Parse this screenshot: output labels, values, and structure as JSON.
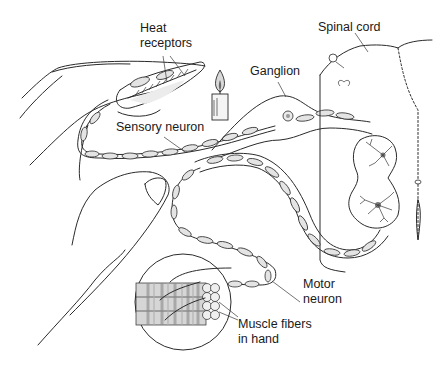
{
  "diagram": {
    "labels": {
      "heat_receptors_line1": "Heat",
      "heat_receptors_line2": "receptors",
      "spinal_cord": "Spinal cord",
      "ganglion": "Ganglion",
      "sensory_neuron": "Sensory neuron",
      "motor_neuron_line1": "Motor",
      "motor_neuron_line2": "neuron",
      "muscle_fibers_line1": "Muscle fibers",
      "muscle_fibers_line2": "in hand"
    },
    "elements": [
      {
        "name": "hand",
        "description": "outline of a hand with extended finger"
      },
      {
        "name": "candle",
        "description": "lit candle near fingertip"
      },
      {
        "name": "heat-receptors",
        "description": "nerve endings in fingertip skin"
      },
      {
        "name": "sensory-neuron",
        "description": "myelinated axon from fingertip to dorsal root ganglion"
      },
      {
        "name": "ganglion",
        "description": "dorsal root ganglion containing sensory cell body"
      },
      {
        "name": "spinal-cord",
        "description": "cross-section of spinal cord with grey matter and interneurons"
      },
      {
        "name": "motor-neuron",
        "description": "myelinated axon from ventral horn to hand muscles"
      },
      {
        "name": "muscle-fibers-inset",
        "description": "circular inset of striated muscle fibers in hand"
      }
    ],
    "colors": {
      "ink": "#2a2a2a",
      "background": "#ffffff",
      "shading": "#e4e4e4"
    }
  }
}
